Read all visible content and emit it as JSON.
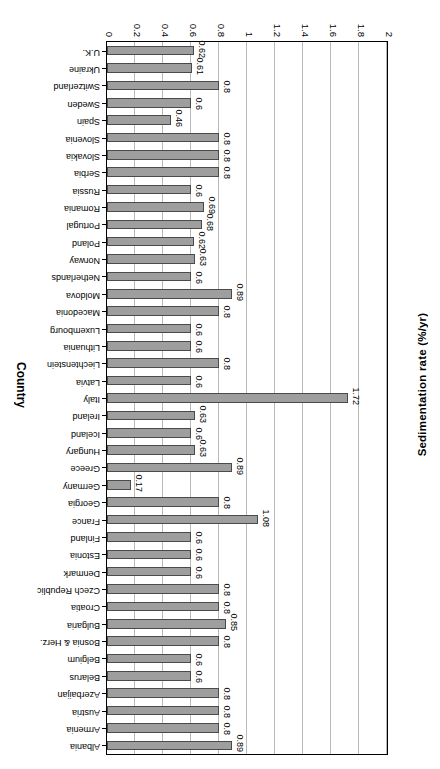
{
  "chart_data": {
    "type": "bar",
    "orientation": "horizontal",
    "title": "",
    "xlabel": "Country",
    "ylabel": "Sedimentation rate (%/yr)",
    "ylim": [
      0,
      2
    ],
    "ytick_labels": [
      "0",
      "0.2",
      "0.4",
      "0.6",
      "0.8",
      "1",
      "1.2",
      "1.4",
      "1.6",
      "1.8",
      "2"
    ],
    "ytick_values": [
      0,
      0.2,
      0.4,
      0.6,
      0.8,
      1,
      1.2,
      1.4,
      1.6,
      1.8,
      2
    ],
    "grid": true,
    "legend": null,
    "categories": [
      "Albania",
      "Armenia",
      "Austria",
      "Azerbaijan",
      "Belarus",
      "Belgium",
      "Bosnia & Herz.",
      "Bulgaria",
      "Croatia",
      "Czech Republic",
      "Denmark",
      "Estonia",
      "Finland",
      "France",
      "Georgia",
      "Germany",
      "Greece",
      "Hungary",
      "Iceland",
      "Ireland",
      "Italy",
      "Latvia",
      "Liechtenstein",
      "Lithuania",
      "Luxembourg",
      "Macedonia",
      "Moldova",
      "Netherlands",
      "Norway",
      "Poland",
      "Portugal",
      "Romania",
      "Russia",
      "Serbia",
      "Slovakia",
      "Slovenia",
      "Spain",
      "Sweden",
      "Switzerland",
      "Ukraine",
      "U.K."
    ],
    "values": [
      0.89,
      0.8,
      0.8,
      0.8,
      0.6,
      0.6,
      0.8,
      0.85,
      0.8,
      0.8,
      0.6,
      0.6,
      0.6,
      1.08,
      0.8,
      0.17,
      0.89,
      0.63,
      0.6,
      0.63,
      1.72,
      0.6,
      0.8,
      0.6,
      0.6,
      0.8,
      0.89,
      0.6,
      0.63,
      0.62,
      0.68,
      0.69,
      0.6,
      0.8,
      0.8,
      0.8,
      0.46,
      0.6,
      0.8,
      0.61,
      0.62
    ],
    "value_labels": [
      "0.89",
      "0.8",
      "0.8",
      "0.8",
      "0.6",
      "0.6",
      "0.8",
      "0.85",
      "0.8",
      "0.8",
      "0.6",
      "0.6",
      "0.6",
      "1.08",
      "0.8",
      "0.17",
      "0.89",
      "0.63",
      "0.6",
      "0.63",
      "1.72",
      "0.6",
      "0.8",
      "0.6",
      "0.6",
      "0.8",
      "0.89",
      "0.6",
      "0.63",
      "0.62",
      "0.68",
      "0.69",
      "0.6",
      "0.8",
      "0.8",
      "0.8",
      "0.46",
      "0.6",
      "0.8",
      "0.61",
      "0.62"
    ],
    "bar_color": "#9e9e9e",
    "bar_edge_color": "#4a4a4a",
    "grid_color": "#b9b9b9"
  },
  "axes": {
    "value_axis_title": "Sedimentation rate (%/yr)",
    "category_axis_title": "Country"
  }
}
